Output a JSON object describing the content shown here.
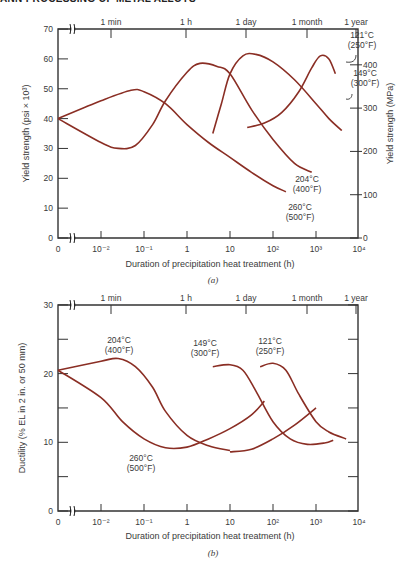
{
  "header": {
    "text": "ANN PROCESSING OF METAL ALLOYS"
  },
  "colors": {
    "curve": "#8a2e24",
    "axis": "#333333",
    "text": "#3a3a3a"
  },
  "chart_data": [
    {
      "type": "line",
      "panel": "(a)",
      "caption": "(a)",
      "xlabel": "Duration of precipitation heat treatment (h)",
      "ylabel": "Yield strength (psi × 10³)",
      "ylabel_right": "Yield strength (MPa)",
      "x_scale": "log",
      "x_ticks": [
        "0",
        "10⁻²",
        "10⁻¹",
        "1",
        "10",
        "10²",
        "10³",
        "10⁴"
      ],
      "x_top_ticks": [
        "1 min",
        "1 h",
        "1 day",
        "1 month",
        "1 year"
      ],
      "y_ticks": [
        0,
        10,
        20,
        30,
        40,
        50,
        60,
        70
      ],
      "y_right_ticks": [
        0,
        100,
        200,
        300,
        400
      ],
      "ylim": [
        0,
        70
      ],
      "grid": false,
      "series": [
        {
          "name": "260°C (500°F)",
          "label_c": "260°C",
          "label_f": "(500°F)",
          "points": [
            [
              "0",
              40
            ],
            [
              -2,
              46
            ],
            [
              -1.3,
              49.5
            ],
            [
              -1,
              49
            ],
            [
              -0.5,
              45
            ],
            [
              0,
              38
            ],
            [
              0.5,
              32
            ],
            [
              1,
              27
            ],
            [
              1.5,
              22
            ],
            [
              2,
              17.5
            ],
            [
              2.3,
              15.5
            ]
          ]
        },
        {
          "name": "204°C (400°F)",
          "label_c": "204°C",
          "label_f": "(400°F)",
          "points": [
            [
              "0",
              40
            ],
            [
              -2,
              32
            ],
            [
              -1.6,
              30
            ],
            [
              -1.2,
              31
            ],
            [
              -0.8,
              38
            ],
            [
              -0.5,
              46
            ],
            [
              0,
              55.5
            ],
            [
              0.3,
              58.5
            ],
            [
              0.7,
              57.5
            ],
            [
              1,
              55
            ],
            [
              1.5,
              43
            ],
            [
              2,
              33
            ],
            [
              2.5,
              25
            ],
            [
              2.9,
              22
            ]
          ]
        },
        {
          "name": "149°C (300°F)",
          "label_c": "149°C",
          "label_f": "(300°F)",
          "points": [
            [
              0.6,
              35
            ],
            [
              0.8,
              45
            ],
            [
              1,
              55
            ],
            [
              1.3,
              61
            ],
            [
              1.6,
              61.5
            ],
            [
              2,
              59
            ],
            [
              2.5,
              53
            ],
            [
              3,
              45
            ],
            [
              3.3,
              40
            ],
            [
              3.6,
              36
            ]
          ]
        },
        {
          "name": "121°C (250°F)",
          "label_c": "121°C",
          "label_f": "(250°F)",
          "points": [
            [
              1.4,
              37
            ],
            [
              1.8,
              38.5
            ],
            [
              2.2,
              42
            ],
            [
              2.6,
              49
            ],
            [
              2.9,
              57
            ],
            [
              3.1,
              61
            ],
            [
              3.3,
              60
            ],
            [
              3.45,
              55
            ]
          ]
        }
      ]
    },
    {
      "type": "line",
      "panel": "(b)",
      "caption": "(b)",
      "xlabel": "Duration of precipitation heat treatment (h)",
      "ylabel": "Ductility (% EL in 2 in. or 50 mm)",
      "x_scale": "log",
      "x_ticks": [
        "0",
        "10⁻²",
        "10⁻¹",
        "1",
        "10",
        "10²",
        "10³",
        "10⁴"
      ],
      "x_top_ticks": [
        "1 min",
        "1 h",
        "1 day",
        "1 month",
        "1 year"
      ],
      "y_ticks": [
        0,
        10,
        20,
        30
      ],
      "ylim": [
        0,
        30
      ],
      "grid": false,
      "series": [
        {
          "name": "204°C (400°F)",
          "label_c": "204°C",
          "label_f": "(400°F)",
          "points": [
            [
              "0",
              20.5
            ],
            [
              -2,
              21.8
            ],
            [
              -1.6,
              22.2
            ],
            [
              -1.2,
              21
            ],
            [
              -0.8,
              18
            ],
            [
              -0.5,
              14.5
            ],
            [
              0,
              11
            ],
            [
              0.5,
              9.5
            ],
            [
              1,
              8.8
            ]
          ]
        },
        {
          "name": "260°C (500°F)",
          "label_c": "260°C",
          "label_f": "(500°F)",
          "points": [
            [
              "0",
              20.5
            ],
            [
              -2,
              16.5
            ],
            [
              -1.5,
              13
            ],
            [
              -1,
              10.5
            ],
            [
              -0.5,
              9.2
            ],
            [
              0,
              9.3
            ],
            [
              0.5,
              10.5
            ],
            [
              1,
              12
            ],
            [
              1.5,
              14
            ],
            [
              1.8,
              16
            ]
          ]
        },
        {
          "name": "149°C (300°F)",
          "label_c": "149°C",
          "label_f": "(300°F)",
          "points": [
            [
              0.6,
              21
            ],
            [
              1,
              21.3
            ],
            [
              1.3,
              20.5
            ],
            [
              1.6,
              17.5
            ],
            [
              2,
              13
            ],
            [
              2.4,
              10.5
            ],
            [
              2.8,
              9.7
            ],
            [
              3.2,
              9.9
            ],
            [
              3.4,
              10.3
            ]
          ]
        },
        {
          "name": "121°C (250°F)",
          "label_c": "121°C",
          "label_f": "(250°F)",
          "points": [
            [
              1.7,
              21
            ],
            [
              2,
              21.5
            ],
            [
              2.3,
              20.5
            ],
            [
              2.6,
              17
            ],
            [
              3,
              13
            ],
            [
              3.3,
              11.5
            ],
            [
              3.7,
              10.5
            ]
          ]
        },
        {
          "name": "260°C low-temperature rise segment",
          "label_c": "",
          "label_f": "",
          "points": [
            [
              1,
              8.6
            ],
            [
              1.5,
              9
            ],
            [
              2,
              10.5
            ],
            [
              2.5,
              12.5
            ],
            [
              3,
              15
            ]
          ]
        }
      ]
    }
  ]
}
